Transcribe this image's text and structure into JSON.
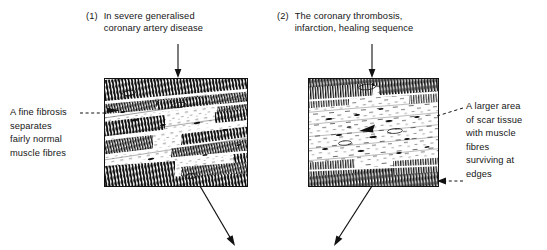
{
  "figure": {
    "type": "diagram"
  },
  "headings": [
    {
      "number": "(1)",
      "lines": [
        "In severe generalised",
        "coronary artery disease"
      ]
    },
    {
      "number": "(2)",
      "lines": [
        "The coronary thrombosis,",
        "infarction, healing sequence"
      ]
    }
  ],
  "captions": {
    "left": {
      "lines": [
        "A fine fibrosis",
        "separates",
        "fairly normal",
        "muscle fibres"
      ]
    },
    "right": {
      "lines": [
        "A larger area",
        "of scar tissue",
        "with muscle",
        "fibres",
        "surviving at",
        "edges"
      ]
    }
  },
  "panels": [
    {
      "name": "panel-diffuse-fibrosis",
      "description": "Dense diagonal bands of striated muscle fibres separated by fine pale fibrosis septa"
    },
    {
      "name": "panel-scar-tissue",
      "description": "Sparse pale scar tissue centrally with dense surviving muscle fibres at top and bottom edges"
    }
  ],
  "connectors": [
    {
      "name": "heading-1-arrow",
      "style": "solid",
      "direction": "down"
    },
    {
      "name": "heading-2-arrow",
      "style": "solid",
      "direction": "down"
    },
    {
      "name": "left-caption-leader",
      "style": "dashed",
      "direction": "right"
    },
    {
      "name": "right-caption-leader",
      "style": "dashed",
      "direction": "down-left"
    },
    {
      "name": "right-edge-leader",
      "style": "dashed",
      "direction": "left"
    },
    {
      "name": "panel-1-outflow-arrow",
      "style": "solid",
      "direction": "down-right"
    },
    {
      "name": "panel-2-outflow-arrow",
      "style": "solid",
      "direction": "down-left"
    }
  ],
  "colors": {
    "ink": "#111111",
    "text": "#161616",
    "background": "#ffffff"
  }
}
